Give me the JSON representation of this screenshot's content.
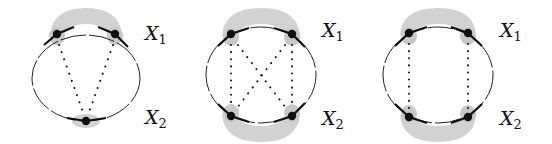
{
  "colors": {
    "ink": "#111111",
    "shade": "#cfcfcf",
    "background": "#ffffff"
  },
  "diagrams": [
    {
      "id": "diagram-1",
      "label_top": "X",
      "label_top_sub": "1",
      "label_bottom": "X",
      "label_bottom_sub": "2",
      "vertices_top": 2,
      "vertices_bottom": 1,
      "connections": "two dotted lines from top vertices converging to single bottom vertex"
    },
    {
      "id": "diagram-2",
      "label_top": "X",
      "label_top_sub": "1",
      "label_bottom": "X",
      "label_bottom_sub": "2",
      "vertices_top": 2,
      "vertices_bottom": 2,
      "connections": "dotted vertical lines and dotted crossing diagonals between top and bottom vertices"
    },
    {
      "id": "diagram-3",
      "label_top": "X",
      "label_top_sub": "1",
      "label_bottom": "X",
      "label_bottom_sub": "2",
      "vertices_top": 2,
      "vertices_bottom": 2,
      "connections": "two parallel dotted vertical lines"
    }
  ]
}
